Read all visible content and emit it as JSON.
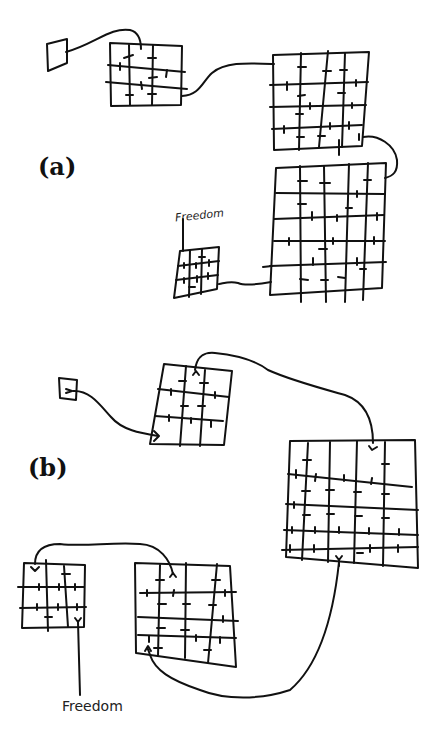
{
  "panels": [
    {
      "label": "(a)",
      "annotation": "Freedom",
      "description": "Chain of grids of increasing size connected by lines, ending at small grid labeled Freedom"
    },
    {
      "label": "(b)",
      "annotation": "Freedom",
      "description": "Chain of grids with arrows looping back from large grid to smaller grids, ending at Freedom"
    }
  ],
  "colors": {
    "ink": "#111111",
    "paper": "#ffffff"
  }
}
